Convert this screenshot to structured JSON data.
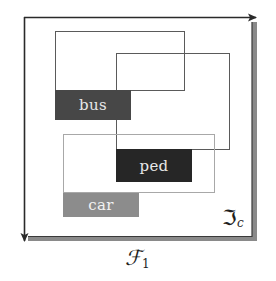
{
  "diagram": {
    "frame": {
      "x_label": "ℱ",
      "x_label_sub": "1",
      "corner_label": "ℑ",
      "corner_label_sub": "c"
    },
    "objects": [
      {
        "label": "bus",
        "fill": "#474747",
        "text_color": "#e6e6e6",
        "box_stroke": "#5a5a5a"
      },
      {
        "label": "ped",
        "fill": "#262626",
        "text_color": "#e6e6e6",
        "box_stroke": "#5a5a5a"
      },
      {
        "label": "car",
        "fill": "#8c8c8c",
        "text_color": "#f0f0f0",
        "box_stroke": "#a8a8a8"
      }
    ],
    "colors": {
      "axis": "#2a2a2a",
      "frame_shadow": "#8a8a8a",
      "background": "#ffffff"
    }
  }
}
